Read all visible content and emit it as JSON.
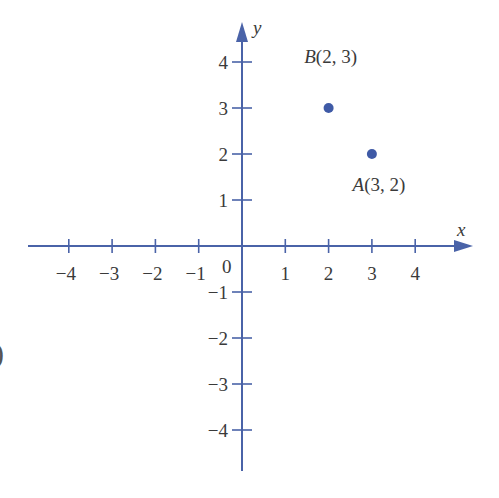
{
  "chart_data": {
    "type": "scatter",
    "title": "",
    "xlabel": "x",
    "ylabel": "y",
    "xlim": [
      -4.5,
      5.3
    ],
    "ylim": [
      -4.9,
      4.9
    ],
    "grid": false,
    "origin_label": "0",
    "x_ticks": [
      -4,
      -3,
      -2,
      -1,
      1,
      2,
      3,
      4
    ],
    "y_ticks": [
      -4,
      -3,
      -2,
      -1,
      1,
      2,
      3,
      4
    ],
    "x_tick_labels": [
      "−4",
      "−3",
      "−2",
      "−1",
      "1",
      "2",
      "3",
      "4"
    ],
    "y_tick_labels": [
      "−4",
      "−3",
      "−2",
      "−1",
      "1",
      "2",
      "3",
      "4"
    ],
    "points": [
      {
        "name": "A",
        "x": 3,
        "y": 2,
        "label": "A(3, 2)"
      },
      {
        "name": "B",
        "x": 2,
        "y": 3,
        "label": "B(2, 3)"
      }
    ],
    "colors": {
      "axis": "#4a63a8",
      "point": "#3f5aa6",
      "text": "#3a3a3a"
    }
  },
  "stray_glyph": ")"
}
